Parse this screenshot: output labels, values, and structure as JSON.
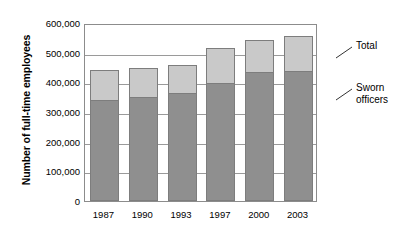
{
  "chart_data": {
    "type": "bar",
    "subtype": "stacked-bar",
    "title": "",
    "xlabel": "",
    "ylabel": "Number of full-time employees",
    "categories": [
      "1987",
      "1990",
      "1993",
      "1997",
      "2000",
      "2003"
    ],
    "series": [
      {
        "name": "Sworn officers",
        "color": "#8f8f8f",
        "values": [
          339000,
          349000,
          363000,
          397000,
          434000,
          437000
        ]
      },
      {
        "name": "Total",
        "color": "#c9c9c9",
        "values": [
          440000,
          447000,
          458000,
          515000,
          542000,
          556000
        ],
        "note": "Top of bar is the total; light segment is total minus sworn officers"
      }
    ],
    "ylim": [
      0,
      600000
    ],
    "ytick_values": [
      0,
      100000,
      200000,
      300000,
      400000,
      500000,
      600000
    ],
    "ytick_labels": [
      "0",
      "100,000",
      "200,000",
      "300,000",
      "400,000",
      "500,000",
      "600,000"
    ],
    "grid": true,
    "grid_axis": "y",
    "legend_position": "right-callouts",
    "annotations": [
      {
        "label": "Total",
        "target_series": "Total"
      },
      {
        "label": "Sworn\nofficers",
        "target_series": "Sworn officers"
      }
    ]
  },
  "callouts": {
    "total_label": "Total",
    "sworn_label": "Sworn\nofficers"
  }
}
